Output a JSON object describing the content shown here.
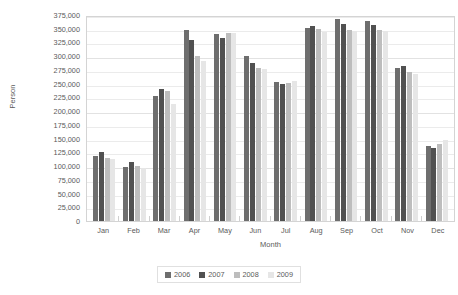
{
  "chart_data": {
    "type": "bar",
    "title": "",
    "xlabel": "Month",
    "ylabel": "Person",
    "ylim": [
      0,
      375000
    ],
    "ytick_step": 25000,
    "grid": true,
    "legend_position": "bottom",
    "categories": [
      "Jan",
      "Feb",
      "Mar",
      "Apr",
      "May",
      "Jun",
      "Jul",
      "Aug",
      "Sep",
      "Oct",
      "Nov",
      "Dec"
    ],
    "ytick_labels": [
      "375,000",
      "350,000",
      "325,000",
      "300,000",
      "275,000",
      "250,000",
      "225,000",
      "200,000",
      "175,000",
      "150,000",
      "125,000",
      "100,000",
      "75,000",
      "50,000",
      "25,000",
      "0"
    ],
    "series": [
      {
        "name": "2006",
        "color": "#6e6e6e",
        "values": [
          118000,
          98000,
          227000,
          348000,
          340000,
          300000,
          253000,
          352000,
          368000,
          365000,
          278000,
          137000
        ]
      },
      {
        "name": "2007",
        "color": "#515151",
        "values": [
          125000,
          108000,
          240000,
          330000,
          333000,
          287000,
          250000,
          355000,
          358000,
          357000,
          283000,
          133000
        ]
      },
      {
        "name": "2008",
        "color": "#bdbdbd",
        "values": [
          115000,
          100000,
          237000,
          300000,
          342000,
          278000,
          252000,
          350000,
          347000,
          348000,
          272000,
          140000
        ]
      },
      {
        "name": "2009",
        "color": "#e6e6e6",
        "values": [
          112000,
          97000,
          213000,
          292000,
          343000,
          277000,
          254000,
          344000,
          345000,
          345000,
          268000,
          148000
        ]
      }
    ]
  }
}
